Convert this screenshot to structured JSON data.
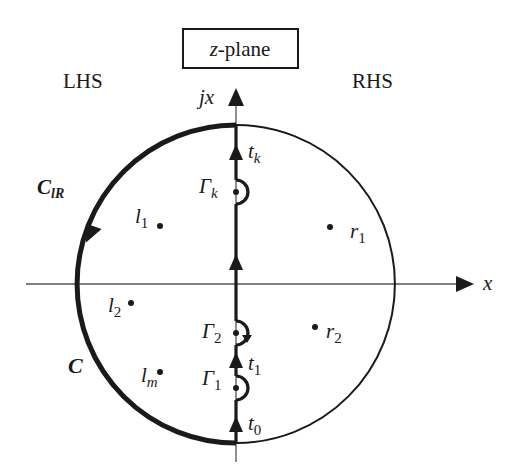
{
  "title_box": {
    "prefix": "z",
    "suffix": "-plane"
  },
  "regions": {
    "left": "LHS",
    "right": "RHS"
  },
  "axes": {
    "x_label": "x",
    "y_label": "jx"
  },
  "contours": {
    "outer": {
      "label": "C"
    },
    "left_arc": {
      "label_main": "C",
      "label_sub": "lR"
    }
  },
  "indentations": [
    {
      "id": "k",
      "label_main": "Γ",
      "label_sub": "k"
    },
    {
      "id": "2",
      "label_main": "Γ",
      "label_sub": "2"
    },
    {
      "id": "1",
      "label_main": "Γ",
      "label_sub": "1"
    }
  ],
  "segments": [
    {
      "id": "k",
      "label_main": "t",
      "label_sub": "k"
    },
    {
      "id": "1",
      "label_main": "t",
      "label_sub": "1"
    },
    {
      "id": "0",
      "label_main": "t",
      "label_sub": "0"
    }
  ],
  "poles": {
    "left": [
      {
        "label_main": "l",
        "label_sub": "1"
      },
      {
        "label_main": "l",
        "label_sub": "2"
      },
      {
        "label_main": "l",
        "label_sub": "m"
      }
    ],
    "right": [
      {
        "label_main": "r",
        "label_sub": "1"
      },
      {
        "label_main": "r",
        "label_sub": "2"
      }
    ]
  },
  "colors": {
    "ink": "#1a1a1a",
    "axis": "#555555",
    "background": "#ffffff"
  }
}
